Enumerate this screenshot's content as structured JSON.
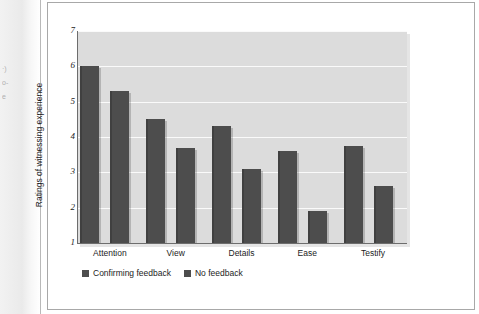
{
  "figure": {
    "margin_fragments": [
      "·)",
      "o-",
      "e"
    ]
  },
  "chart_data": {
    "type": "bar",
    "title": "",
    "xlabel": "",
    "ylabel": "Ratings of witnessing experience",
    "ylim": [
      1,
      7
    ],
    "yticks": [
      1,
      2,
      3,
      4,
      5,
      6,
      7
    ],
    "grid": true,
    "legend_position": "bottom-left",
    "categories": [
      "Attention",
      "View",
      "Details",
      "Ease",
      "Testify"
    ],
    "series": [
      {
        "name": "Confirming feedback",
        "color": "#4d4d4d",
        "values": [
          6.0,
          4.5,
          4.3,
          3.6,
          3.75
        ]
      },
      {
        "name": "No feedback",
        "color": "#4d4d4d",
        "values": [
          5.3,
          3.7,
          3.1,
          1.9,
          2.6
        ]
      }
    ]
  }
}
